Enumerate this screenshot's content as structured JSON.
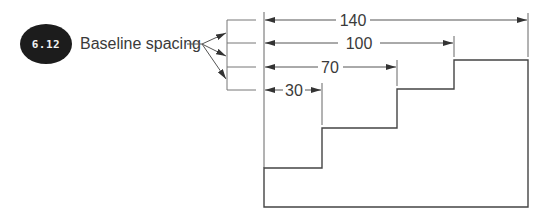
{
  "figure": {
    "badge": {
      "number": "6.12",
      "color": "#1c1c1c"
    },
    "label": "Baseline spacing",
    "line_color": "#555555",
    "dimensions": [
      {
        "value": "140",
        "y": 20,
        "x_end": 528
      },
      {
        "value": "100",
        "y": 43,
        "x_end": 454
      },
      {
        "value": "70",
        "y": 67,
        "x_end": 397
      },
      {
        "value": "30",
        "y": 90,
        "x_end": 322
      }
    ],
    "baseline_x": 264,
    "part_profile": {
      "description": "stepped part with four steps",
      "steps": [
        {
          "x_start": 264,
          "x_end": 322,
          "top_y": 168
        },
        {
          "x_start": 322,
          "x_end": 397,
          "top_y": 128
        },
        {
          "x_start": 397,
          "x_end": 454,
          "top_y": 89
        },
        {
          "x_start": 454,
          "x_end": 528,
          "top_y": 60
        }
      ],
      "bottom_y": 207
    }
  }
}
